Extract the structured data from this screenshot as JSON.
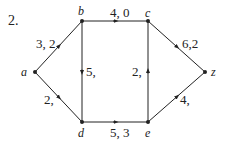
{
  "problem_number": "2.",
  "colors": {
    "stroke": "#222222",
    "text": "#222222",
    "background": "#ffffff"
  },
  "nodes": [
    {
      "id": "a",
      "label": "a",
      "x": 35,
      "y": 72
    },
    {
      "id": "b",
      "label": "b",
      "x": 82,
      "y": 21
    },
    {
      "id": "c",
      "label": "c",
      "x": 148,
      "y": 21
    },
    {
      "id": "z",
      "label": "z",
      "x": 205,
      "y": 72
    },
    {
      "id": "d",
      "label": "d",
      "x": 82,
      "y": 122
    },
    {
      "id": "e",
      "label": "e",
      "x": 148,
      "y": 122
    }
  ],
  "edges": [
    {
      "from": "a",
      "to": "b",
      "label": "3, 2"
    },
    {
      "from": "b",
      "to": "c",
      "label": "4, 0"
    },
    {
      "from": "b",
      "to": "d",
      "label": "5,"
    },
    {
      "from": "a",
      "to": "d",
      "label": "2,"
    },
    {
      "from": "d",
      "to": "e",
      "label": "5, 3"
    },
    {
      "from": "e",
      "to": "c",
      "label": "2,"
    },
    {
      "from": "c",
      "to": "z",
      "label": "6,2"
    },
    {
      "from": "e",
      "to": "z",
      "label": "4,"
    }
  ]
}
